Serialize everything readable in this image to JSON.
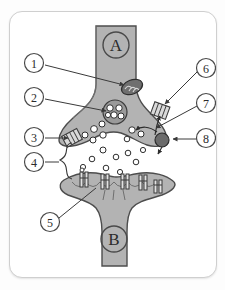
{
  "figure": {
    "title_visible": false,
    "kind": "synapse-diagram",
    "background_color": "#fdfdfd",
    "card_color": "#ffffff",
    "cell_fill": "#b3b3b3",
    "cell_stroke": "#4d4d4d",
    "cleft_color": "#ffffff",
    "ink": "#3a3a3a"
  },
  "cells": {
    "presynaptic": {
      "letter": "A"
    },
    "postsynaptic": {
      "letter": "B"
    }
  },
  "callouts": [
    {
      "id": 1,
      "label": "1",
      "side": "left",
      "cx": 24,
      "cy": 51,
      "tx": 120,
      "ty": 74
    },
    {
      "id": 2,
      "label": "2",
      "side": "left",
      "cx": 24,
      "cy": 85,
      "tx": 103,
      "ty": 100
    },
    {
      "id": 3,
      "label": "3",
      "side": "left",
      "cx": 24,
      "cy": 125,
      "tx": 64,
      "ty": 126
    },
    {
      "id": 4,
      "label": "4",
      "side": "left",
      "cx": 24,
      "cy": 150,
      "tx": 56,
      "ty": 150
    },
    {
      "id": 5,
      "label": "5",
      "side": "left",
      "cx": 40,
      "cy": 210,
      "tx": 83,
      "ty": 179
    },
    {
      "id": 6,
      "label": "6",
      "side": "right",
      "cx": 196,
      "cy": 56,
      "tx": 152,
      "ty": 95
    },
    {
      "id": 7,
      "label": "7",
      "side": "right",
      "cx": 196,
      "cy": 91,
      "tx": 141,
      "ty": 118
    },
    {
      "id": 8,
      "label": "8",
      "side": "right",
      "cx": 196,
      "cy": 126,
      "tx": 164,
      "ty": 126
    }
  ],
  "structures": {
    "mitochondrion": "mitochondrion-icon",
    "vesicle_cluster": "vesicle-cluster-icon",
    "membrane_channel_left": "ion-channel-icon",
    "membrane_channel_right": "ion-channel-icon",
    "reuptake_transporter": "reuptake-transporter-icon",
    "cleft_bracket": "brace-icon",
    "receptors": "receptor-icon",
    "neurotransmitters": "neurotransmitter-dot"
  },
  "counts": {
    "cleft_neurotransmitters": 9,
    "docked_vesicles": 8,
    "cluster_vesicles": 5,
    "postsynaptic_receptors": 5
  }
}
